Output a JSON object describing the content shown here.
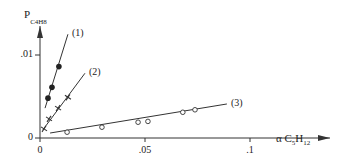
{
  "chart_data": {
    "type": "scatter",
    "title": "",
    "xlabel": "α C5H12",
    "ylabel": "P C4H8",
    "xlabel_parts": {
      "prefix": "α C",
      "sub1": "5",
      "mid": "H",
      "sub2": "12"
    },
    "ylabel_parts": {
      "prefix": "P",
      "sub_text": "C4H8"
    },
    "xlim": [
      0,
      0.12
    ],
    "ylim": [
      0,
      0.012
    ],
    "x_ticks": [
      {
        "value": 0,
        "label": "0"
      },
      {
        "value": 0.05,
        "label": ".05"
      },
      {
        "value": 0.1,
        "label": ".1"
      }
    ],
    "y_ticks": [
      {
        "value": 0,
        "label": "0"
      },
      {
        "value": 0.01,
        "label": ".01"
      }
    ],
    "grid": false,
    "series": [
      {
        "name": "(1)",
        "marker": "filled-circle",
        "x": [
          0.0038,
          0.0057,
          0.009
        ],
        "y": [
          0.0048,
          0.0061,
          0.0086
        ],
        "fit_line": {
          "x": [
            0.0024,
            0.0133
          ],
          "y": [
            0.0036,
            0.0125
          ]
        }
      },
      {
        "name": "(2)",
        "marker": "cross",
        "x": [
          0.0019,
          0.0043,
          0.0086,
          0.0133
        ],
        "y": [
          0.0011,
          0.0023,
          0.0036,
          0.0049
        ],
        "fit_line": {
          "x": [
            0.0014,
            0.0214
          ],
          "y": [
            0.001,
            0.0078
          ]
        }
      },
      {
        "name": "(3)",
        "marker": "open-circle",
        "x": [
          0.0129,
          0.0295,
          0.0467,
          0.0514,
          0.068,
          0.0738
        ],
        "y": [
          0.0007,
          0.0013,
          0.0019,
          0.002,
          0.0031,
          0.0034
        ],
        "fit_line": {
          "x": [
            0.0048,
            0.089
          ],
          "y": [
            0.0006,
            0.0041
          ]
        }
      }
    ]
  }
}
